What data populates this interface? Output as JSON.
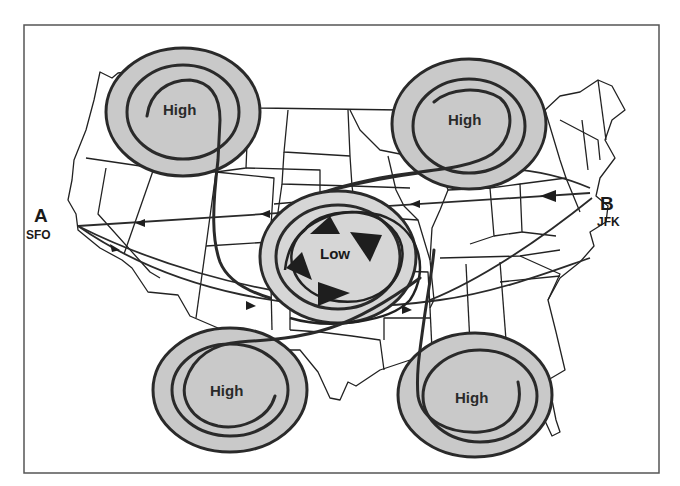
{
  "diagram": {
    "type": "weather-map",
    "region": "Continental United States",
    "colors": {
      "background": "#ffffff",
      "pressure_fill": "#c9c9c9",
      "line": "#2a2a2a",
      "frame": "#555555"
    },
    "points": [
      {
        "id": "A",
        "letter": "A",
        "airport": "SFO"
      },
      {
        "id": "B",
        "letter": "B",
        "airport": "JFK"
      }
    ],
    "pressure_systems": [
      {
        "id": "high-northwest",
        "label": "High"
      },
      {
        "id": "high-northeast",
        "label": "High"
      },
      {
        "id": "low-center",
        "label": "Low"
      },
      {
        "id": "high-southwest",
        "label": "High"
      },
      {
        "id": "high-southeast",
        "label": "High"
      }
    ]
  }
}
